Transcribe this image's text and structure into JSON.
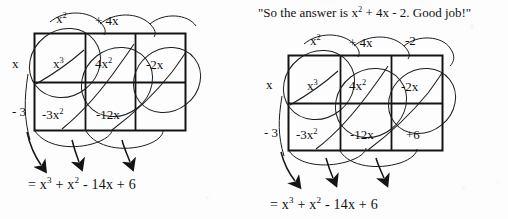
{
  "page": {
    "background": "#fdfdfd",
    "ink": "#141414"
  },
  "panels": [
    {
      "id": "left",
      "name": "incomplete-grid",
      "caption": "",
      "column_headers": [
        "x",
        "+ 4x",
        ""
      ],
      "column_header_display": [
        "x²",
        "+ 4x",
        ""
      ],
      "row_labels": [
        "x",
        "- 3"
      ],
      "cells": [
        [
          "x",
          "4x",
          "-2x"
        ],
        [
          "-3x",
          "-12x",
          ""
        ]
      ],
      "cells_display": [
        [
          "x³",
          "4x²",
          "-2x"
        ],
        [
          "-3x²",
          "-12x",
          ""
        ]
      ],
      "answer": "= x³ + x² - 14x + 6",
      "answer_parts": [
        "=",
        "x",
        "3",
        "+",
        "x",
        "2",
        "-",
        "14x",
        "+",
        "6"
      ]
    },
    {
      "id": "right",
      "name": "complete-grid",
      "caption": "\"So the answer is  x² + 4x - 2.  Good job!\"",
      "caption_parts": {
        "lead": "\"So the answer is",
        "term1": "x",
        "term1_exp": "2",
        "rest": "+ 4x - 2.  Good job!\""
      },
      "column_headers": [
        "x²",
        "+ 4x",
        "-2"
      ],
      "column_header_display": [
        "x²",
        "+ 4x",
        "-2"
      ],
      "row_labels": [
        "x",
        "- 3"
      ],
      "cells": [
        [
          "x",
          "4x",
          "-2x"
        ],
        [
          "-3x",
          "-12x",
          "+6"
        ]
      ],
      "cells_display": [
        [
          "x³",
          "4x²",
          "-2x"
        ],
        [
          "-3x²",
          "-12x",
          "+6"
        ]
      ],
      "answer": "= x³ + x² - 14x + 6",
      "answer_parts": [
        "=",
        "x",
        "3",
        "+",
        "x",
        "2",
        "-",
        "14x",
        "+",
        "6"
      ]
    }
  ],
  "symbols": {
    "equals": "=",
    "plus": "+",
    "minus": "-",
    "exp_three": "3",
    "exp_two": "2",
    "x_base": "x",
    "term_14x": "14x",
    "term_6": "6"
  },
  "annotations": {
    "arrow_count_per_panel": 3,
    "loop_count_per_panel": 3,
    "diagonal_count_per_panel": 3
  }
}
